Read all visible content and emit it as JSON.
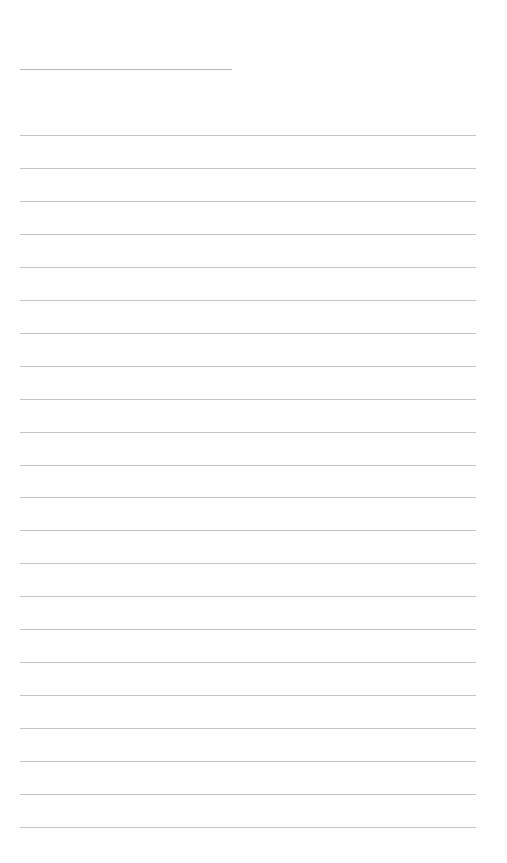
{
  "page": {
    "type": "lined-paper",
    "background_color": "#fefefe",
    "line_color": "#c4c4c4",
    "title_line": {
      "x": 20,
      "y": 69,
      "width": 212
    },
    "rules": {
      "count": 22,
      "x": 20,
      "width": 456,
      "first_y": 135,
      "spacing": 32.95
    }
  }
}
